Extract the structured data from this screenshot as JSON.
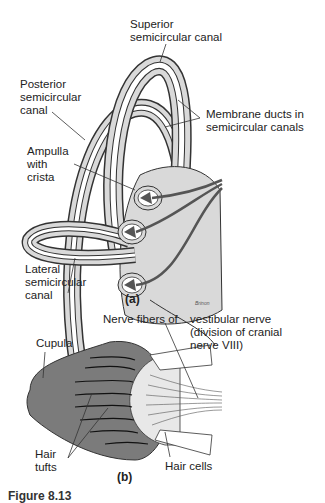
{
  "colors": {
    "canal_fill": "#d9d9d9",
    "outline": "#333333",
    "cupula_fill": "#7b7b7b",
    "crista_fill": "#555555",
    "nerve": "#555555"
  },
  "panel_a": {
    "caption": "(a)",
    "labels": {
      "superior": "Superior\nsemicircular canal",
      "posterior": "Posterior\nsemicircular\ncanal",
      "membrane": "Membrane ducts in\nsemicircular canals",
      "ampulla": "Ampulla\nwith\ncrista",
      "lateral": "Lateral\nsemicircular\ncanal"
    },
    "signature": "Brinon"
  },
  "panel_b": {
    "caption": "(b)",
    "labels": {
      "nerve_fibers": "Nerve fibers of",
      "vestibular": "vestibular nerve\n(division of cranial\nnerve VIII)",
      "cupula": "Cupula",
      "hair_tufts": "Hair\ntufts",
      "hair_cells": "Hair cells"
    }
  },
  "figure_label": "Figure 8.13"
}
